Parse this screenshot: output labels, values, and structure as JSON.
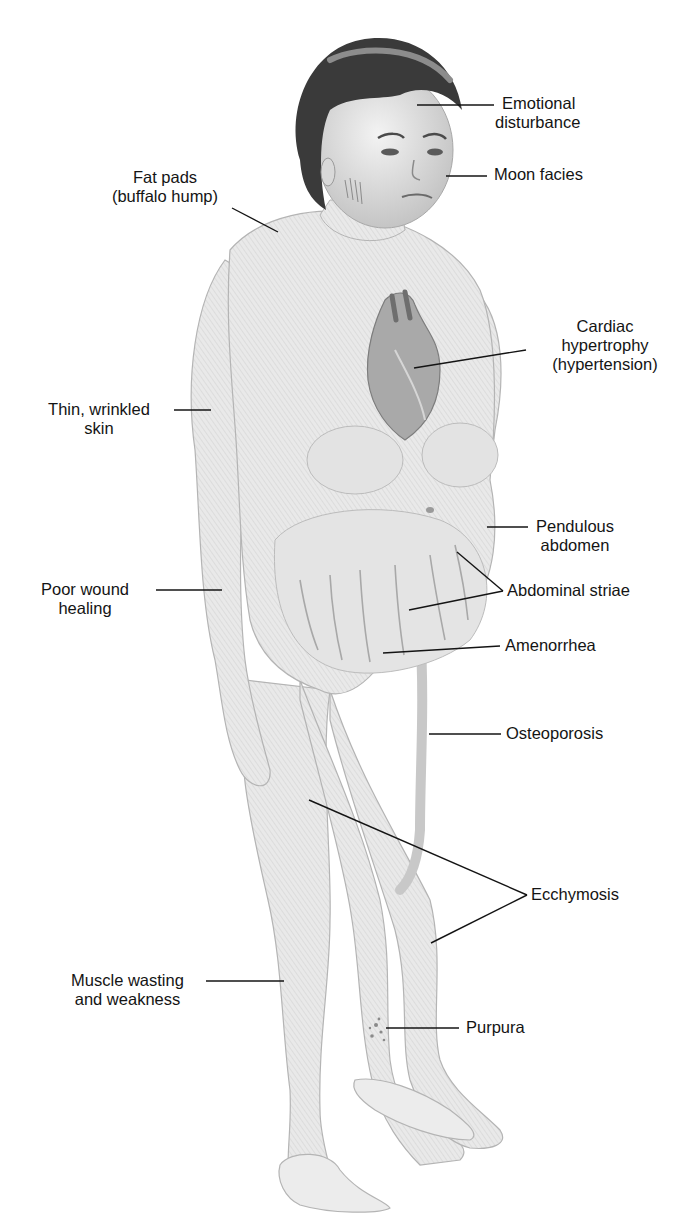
{
  "figure": {
    "ink_color": "#141414",
    "skin_color": "#e6e6e6",
    "hair_color": "#3a3a3a"
  },
  "labels": {
    "emotional": {
      "lines": [
        "Emotional",
        "disturbance"
      ]
    },
    "moon": {
      "lines": [
        "Moon facies"
      ]
    },
    "fatpads": {
      "lines": [
        "Fat pads",
        "(buffalo hump)"
      ]
    },
    "cardiac": {
      "lines": [
        "Cardiac",
        "hypertrophy",
        "(hypertension)"
      ]
    },
    "thinskin": {
      "lines": [
        "Thin, wrinkled",
        "skin"
      ]
    },
    "pendulous": {
      "lines": [
        "Pendulous",
        "abdomen"
      ]
    },
    "striae": {
      "lines": [
        "Abdominal striae"
      ]
    },
    "wound": {
      "lines": [
        "Poor wound",
        "healing"
      ]
    },
    "amenorrhea": {
      "lines": [
        "Amenorrhea"
      ]
    },
    "osteoporosis": {
      "lines": [
        "Osteoporosis"
      ]
    },
    "ecchymosis": {
      "lines": [
        "Ecchymosis"
      ]
    },
    "muscle": {
      "lines": [
        "Muscle wasting",
        "and weakness"
      ]
    },
    "purpura": {
      "lines": [
        "Purpura"
      ]
    }
  }
}
